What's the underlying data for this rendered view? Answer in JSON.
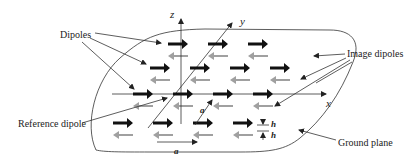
{
  "figure": {
    "labels": {
      "dipoles": "Dipoles",
      "image_dipoles": "Image dipoles",
      "reference_dipole": "Reference dipole",
      "ground_plane": "Ground plane"
    },
    "axes": {
      "x": "x",
      "y": "y",
      "z": "z"
    },
    "dimensions": {
      "spacing": "a",
      "spacing_diag": "a",
      "height_top": "h",
      "height_bottom": "h"
    },
    "colors": {
      "dipole": "#111111",
      "image_dipole": "#a0a0a0",
      "line": "#333333"
    },
    "grid": {
      "rows": [
        {
          "count": 3
        },
        {
          "count": 4
        },
        {
          "count": 4
        },
        {
          "count": 4
        }
      ]
    }
  }
}
